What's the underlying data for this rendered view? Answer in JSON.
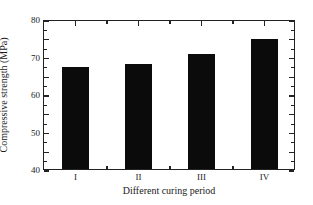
{
  "chart_data": {
    "type": "bar",
    "title": "",
    "subtitle": "",
    "categories": [
      "I",
      "II",
      "III",
      "IV"
    ],
    "values": [
      54.3,
      55.8,
      61.5,
      69.5
    ],
    "series": [
      {
        "name": "Compressive strength",
        "values": [
          54.3,
          55.8,
          61.5,
          69.5
        ]
      }
    ],
    "xlabel": "Different curing period",
    "ylabel": "Compressive strength (MPa)",
    "ylim": [
      0,
      80
    ],
    "y_ticks": [
      0,
      10,
      20,
      30,
      40,
      50,
      60,
      70,
      80
    ],
    "y_tick_labels": [
      "0",
      "10",
      "20",
      "30",
      "40",
      "50",
      "60",
      "70",
      "80"
    ],
    "y_minor_step": 5,
    "x_tick_labels": [
      "I",
      "II",
      "III",
      "IV"
    ],
    "grid": false,
    "legend": null,
    "legend_position": "none",
    "bar_color": "#0b0b0b",
    "axis_color": "#222222",
    "background_color": "#ffffff",
    "frame": "box",
    "tick_direction": "in",
    "annotations": []
  }
}
